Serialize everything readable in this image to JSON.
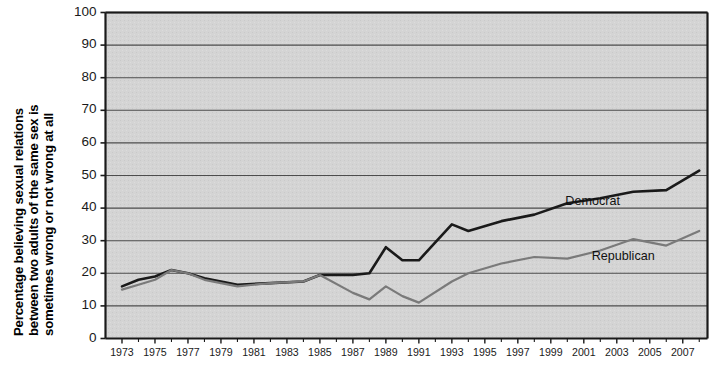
{
  "chart_data": {
    "type": "line",
    "title": "",
    "xlabel": "",
    "ylabel": "Percentage believing sexual relations between two adults of the same sex is sometimes wrong or not wrong at all",
    "ylabel_lines": [
      "Percentage believing sexual relations",
      "between two adults of the same sex is",
      "sometimes wrong or not wrong at all"
    ],
    "ylim": [
      0,
      100
    ],
    "ytick_values": [
      0,
      10,
      20,
      30,
      40,
      50,
      60,
      70,
      80,
      90,
      100
    ],
    "ytick_labels": [
      "0",
      "10",
      "20",
      "30",
      "40",
      "50",
      "60",
      "70",
      "80",
      "90",
      "100"
    ],
    "xlim": [
      1972,
      2008.5
    ],
    "xtick_values": [
      1973,
      1975,
      1977,
      1979,
      1981,
      1983,
      1985,
      1987,
      1989,
      1991,
      1993,
      1995,
      1997,
      1999,
      2001,
      2003,
      2005,
      2007
    ],
    "xtick_labels": [
      "1973",
      "1975",
      "1977",
      "1979",
      "1981",
      "1983",
      "1985",
      "1987",
      "1989",
      "1991",
      "1993",
      "1995",
      "1997",
      "1999",
      "2001",
      "2003",
      "2005",
      "2007"
    ],
    "grid": true,
    "grid_axis": "y",
    "grid_color": "#4d4d4d",
    "plot_background": "#d4d4d4",
    "legend_position": "inline-annotations",
    "series": [
      {
        "name": "Democrat",
        "color": "#1a1a1a",
        "line_width": 2.6,
        "label_x": 2000,
        "label_y": 42,
        "x": [
          1973,
          1974,
          1975,
          1976,
          1977,
          1978,
          1980,
          1982,
          1984,
          1985,
          1987,
          1988,
          1989,
          1990,
          1991,
          1993,
          1994,
          1996,
          1998,
          2000,
          2002,
          2004,
          2006,
          2008
        ],
        "values": [
          16,
          18,
          19,
          21,
          20,
          18.5,
          16.5,
          17,
          17.5,
          19.5,
          19.5,
          20,
          28,
          24,
          24,
          35,
          33,
          36,
          38,
          41.5,
          43,
          45,
          45.5,
          51.5
        ]
      },
      {
        "name": "Republican",
        "color": "#7a7a7a",
        "line_width": 2.2,
        "label_x": 2001.6,
        "label_y": 25,
        "x": [
          1973,
          1974,
          1975,
          1976,
          1977,
          1978,
          1980,
          1982,
          1984,
          1985,
          1987,
          1988,
          1989,
          1990,
          1991,
          1993,
          1994,
          1996,
          1998,
          2000,
          2002,
          2004,
          2006,
          2008
        ],
        "values": [
          15,
          16.5,
          18,
          21,
          20,
          18,
          16,
          17,
          17.5,
          19.5,
          14,
          12,
          16,
          13,
          11,
          17.5,
          20,
          23,
          25,
          24.5,
          27,
          30.5,
          28.5,
          33
        ]
      }
    ],
    "annotations": [
      {
        "text": "Democrat",
        "x": 2000,
        "y": 42
      },
      {
        "text": "Republican",
        "x": 2001.6,
        "y": 25
      }
    ]
  }
}
